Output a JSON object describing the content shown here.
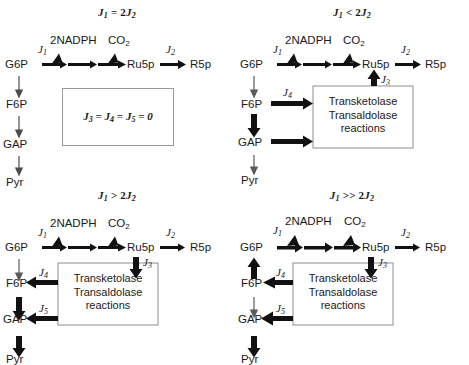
{
  "figure": {
    "nodes": {
      "g6p": "G6P",
      "f6p": "F6P",
      "gap": "GAP",
      "pyr": "Pyr",
      "ru5p": "Ru5p",
      "r5p": "R5p"
    },
    "cofactors": {
      "nadph": "2NADPH",
      "co2": "CO",
      "co2_sub": "2"
    },
    "flux_labels": {
      "j1": "J",
      "j1_sub": "1",
      "j2": "J",
      "j2_sub": "2",
      "j3": "J",
      "j3_sub": "3",
      "j4": "J",
      "j4_sub": "4",
      "j5": "J",
      "j5_sub": "5"
    },
    "enzyme_box": {
      "line1": "Transketolase",
      "line2": "Transaldolase",
      "line3": "reactions"
    },
    "zero_box": {
      "text": "J3 = J4 = J5 = 0",
      "j": "J",
      "s3": "3",
      "s4": "4",
      "s5": "5",
      "eq": " = ",
      "zero": "0"
    },
    "panels": [
      {
        "id": "panel-j1-equals-2j2",
        "title_main": "J",
        "title_sub1": "1",
        "title_op": " = 2",
        "title_main2": "J",
        "title_sub2": "2",
        "title_plain": "J1 = 2J2",
        "has_enzyme_box": false,
        "has_zero_box": true
      },
      {
        "id": "panel-j1-less-2j2",
        "title_main": "J",
        "title_sub1": "1",
        "title_op": " < 2",
        "title_main2": "J",
        "title_sub2": "2",
        "title_plain": "J1 < 2J2",
        "has_enzyme_box": true,
        "has_zero_box": false
      },
      {
        "id": "panel-j1-greater-2j2",
        "title_main": "J",
        "title_sub1": "1",
        "title_op": " > 2",
        "title_main2": "J",
        "title_sub2": "2",
        "title_plain": "J1 > 2J2",
        "has_enzyme_box": true,
        "has_zero_box": false
      },
      {
        "id": "panel-j1-muchgreater-2j2",
        "title_main": "J",
        "title_sub1": "1",
        "title_op": " >> 2",
        "title_main2": "J",
        "title_sub2": "2",
        "title_plain": "J1 >> 2J2",
        "has_enzyme_box": true,
        "has_zero_box": false
      }
    ],
    "colors": {
      "stroke": "#111111",
      "box_border": "#8e8e8e",
      "thin_arrow": "#4d4d4d",
      "background": "#ffffff"
    }
  }
}
